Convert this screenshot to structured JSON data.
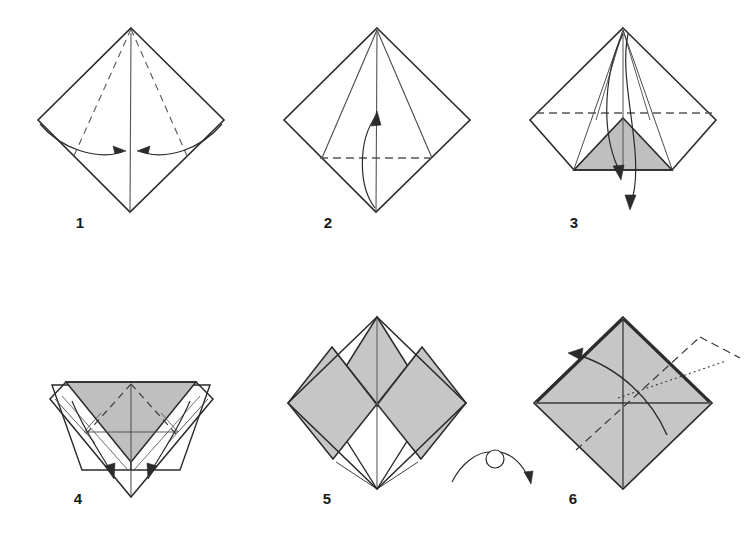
{
  "page": {
    "background_color": "#ffffff",
    "width": 754,
    "height": 541
  },
  "style": {
    "paper_front_color": "#ffffff",
    "paper_back_color": "#bfbfbf",
    "paper_back_color_light": "#c6c6c6",
    "line_color": "#333333",
    "edge_color": "#2b2b2b",
    "fold_line_color": "#555555",
    "arrow_color": "#2b2b2b",
    "label_color": "#1a1a1a",
    "dash_pattern": "7 5",
    "dot_pattern": "2 3"
  },
  "steps": [
    {
      "id": "step-1",
      "label": "1",
      "label_x": 80,
      "label_y": 228,
      "center_x": 131,
      "center_y": 120,
      "description": "Square sheet as a diamond. Vertical valley crease down the middle; two mountain-dashed creases run from the top point to the lower edges. Two curved arrows show the left and right lower edges folding in to the centre line.",
      "fill": "none",
      "shape": "kite-diamond",
      "arrows": [
        {
          "name": "fold-left-edge-to-center",
          "direction": "right"
        },
        {
          "name": "fold-right-edge-to-center",
          "direction": "left"
        }
      ],
      "creases": [
        {
          "name": "vertical-center-crease",
          "type": "solid"
        },
        {
          "name": "left-diagonal-crease",
          "type": "dashed"
        },
        {
          "name": "right-diagonal-crease",
          "type": "dashed"
        }
      ]
    },
    {
      "id": "step-2",
      "label": "2",
      "label_x": 328,
      "label_y": 228,
      "center_x": 377,
      "center_y": 120,
      "description": "Both lower edges have been folded to the centre, forming a kite. A horizontal dashed crease crosses the widest points; a curved arrow shows the bottom point folding up to the centre.",
      "fill": "none",
      "shape": "kite-diamond",
      "arrows": [
        {
          "name": "fold-bottom-point-up",
          "direction": "up"
        }
      ],
      "creases": [
        {
          "name": "vertical-center-crease",
          "type": "solid"
        },
        {
          "name": "horizontal-crease",
          "type": "dashed"
        },
        {
          "name": "left-flap-edge",
          "type": "solid"
        },
        {
          "name": "right-flap-edge",
          "type": "solid"
        }
      ]
    },
    {
      "id": "step-3",
      "label": "3",
      "label_x": 574,
      "label_y": 228,
      "center_x": 623,
      "center_y": 120,
      "description": "The bottom point is folded up, showing a grey triangle of the reverse side. A horizontal dashed crease runs through the centre and two arrows point down, unfolding the flap again.",
      "fill": "grey-triangle",
      "shape": "kite-diamond",
      "arrows": [
        {
          "name": "unfold-flap-down-short",
          "direction": "down"
        },
        {
          "name": "unfold-flap-down-long",
          "direction": "down"
        }
      ],
      "creases": [
        {
          "name": "vertical-center-crease",
          "type": "solid"
        },
        {
          "name": "horizontal-crease",
          "type": "dashed"
        }
      ]
    },
    {
      "id": "step-4",
      "label": "4",
      "label_x": 78,
      "label_y": 504,
      "center_x": 131,
      "center_y": 415,
      "description": "The model turned into a downward chevron. A grey inverted triangle sits in the middle between two white flaps. Dashed diagonal creases and two inward arrows show the side flaps folding to the centre.",
      "fill": "grey-chevron",
      "shape": "chevron",
      "arrows": [
        {
          "name": "fold-left-flap-in",
          "direction": "down-right"
        },
        {
          "name": "fold-right-flap-in",
          "direction": "down-left"
        }
      ],
      "creases": [
        {
          "name": "left-diagonal-crease",
          "type": "dashed"
        },
        {
          "name": "right-diagonal-crease",
          "type": "dashed"
        },
        {
          "name": "vertical-center-crease",
          "type": "solid"
        }
      ]
    },
    {
      "id": "step-5",
      "label": "5",
      "label_x": 327,
      "label_y": 504,
      "center_x": 377,
      "center_y": 413,
      "description": "Completed preliminary-style base: a diamond with a large grey upper triangle, two grey side panels and a small white V at the bottom.",
      "fill": "grey-diamond-with-white-v",
      "shape": "diamond",
      "arrows": [],
      "creases": [
        {
          "name": "vertical-center-crease",
          "type": "solid"
        },
        {
          "name": "left-panel-edge",
          "type": "solid"
        },
        {
          "name": "right-panel-edge",
          "type": "solid"
        }
      ]
    },
    {
      "id": "step-6",
      "label": "6",
      "label_x": 573,
      "label_y": 504,
      "center_x": 623,
      "center_y": 413,
      "description": "The model turned over: a plain grey diamond crossed by vertical and horizontal creases, a dashed diagonal crease, a dotted hidden line and a curved arrow pulling the right flap over to the upper left.",
      "fill": "grey-diamond",
      "shape": "diamond",
      "arrows": [
        {
          "name": "swing-flap-to-upper-left",
          "direction": "up-left"
        }
      ],
      "creases": [
        {
          "name": "vertical-center-crease",
          "type": "solid"
        },
        {
          "name": "horizontal-center-crease",
          "type": "solid"
        },
        {
          "name": "diagonal-dashed-crease",
          "type": "dashed"
        },
        {
          "name": "hidden-dotted-line",
          "type": "dotted"
        }
      ]
    }
  ],
  "symbols": [
    {
      "id": "turn-over-symbol",
      "name": "turn-over-symbol",
      "label": "",
      "x": 490,
      "y": 480,
      "description": "Standard origami turn-over symbol: an arc with a small loop at its apex and an arrowhead at the right end."
    }
  ]
}
